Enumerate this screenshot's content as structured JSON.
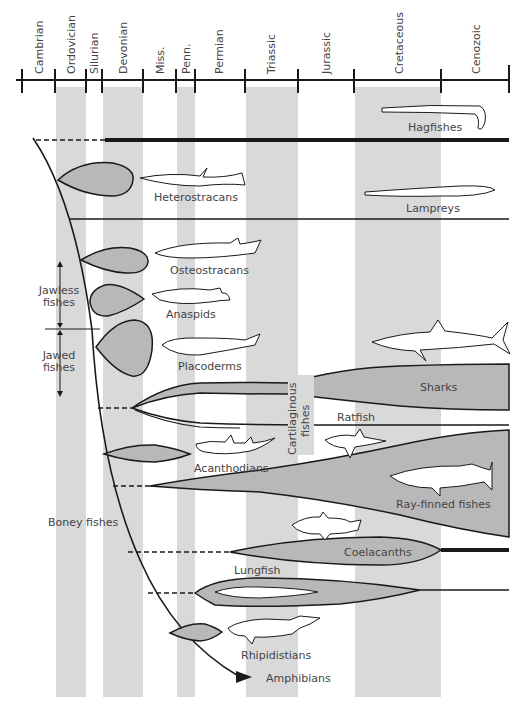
{
  "colors": {
    "band": "#d9d9d9",
    "fill": "#b8b8b8",
    "line": "#1a1a1a",
    "text": "#444444"
  },
  "time_axis": {
    "periods": [
      {
        "name": "Cambrian",
        "x0": 22,
        "x1": 55,
        "shaded": false
      },
      {
        "name": "Ordovician",
        "x0": 55,
        "x1": 86,
        "shaded": true
      },
      {
        "name": "Silurian",
        "x0": 86,
        "x1": 102,
        "shaded": false
      },
      {
        "name": "Devonian",
        "x0": 102,
        "x1": 143,
        "shaded": true
      },
      {
        "name": "Miss.",
        "x0": 143,
        "x1": 176,
        "shaded": false
      },
      {
        "name": "Penn.",
        "x0": 176,
        "x1": 195,
        "shaded": true
      },
      {
        "name": "Permian",
        "x0": 195,
        "x1": 245,
        "shaded": false
      },
      {
        "name": "Triassic",
        "x0": 245,
        "x1": 298,
        "shaded": true
      },
      {
        "name": "Jurassic",
        "x0": 298,
        "x1": 354,
        "shaded": false
      },
      {
        "name": "Cretaceous",
        "x0": 354,
        "x1": 441,
        "shaded": true
      },
      {
        "name": "Cenozoic",
        "x0": 441,
        "x1": 509,
        "shaded": false
      }
    ]
  },
  "groups": {
    "jawless": "Jawless fishes",
    "jawless_line1": "Jawless",
    "jawless_line2": "fishes",
    "jawed": "Jawed fishes",
    "jawed_line1": "Jawed",
    "jawed_line2": "fishes",
    "cartilaginous_line1": "Cartilaginous",
    "cartilaginous_line2": "fishes",
    "boney": "Boney fishes"
  },
  "taxa": [
    {
      "id": "hagfishes",
      "label": "Hagfishes"
    },
    {
      "id": "heterostracans",
      "label": "Heterostracans"
    },
    {
      "id": "lampreys",
      "label": "Lampreys"
    },
    {
      "id": "osteostracans",
      "label": "Osteostracans"
    },
    {
      "id": "anaspids",
      "label": "Anaspids"
    },
    {
      "id": "placoderms",
      "label": "Placoderms"
    },
    {
      "id": "sharks",
      "label": "Sharks"
    },
    {
      "id": "ratfish",
      "label": "Ratfish"
    },
    {
      "id": "acanthodians",
      "label": "Acanthodians"
    },
    {
      "id": "ray-finned",
      "label": "Ray-finned fishes"
    },
    {
      "id": "coelacanths",
      "label": "Coelacanths"
    },
    {
      "id": "lungfish",
      "label": "Lungfish"
    },
    {
      "id": "rhipidistians",
      "label": "Rhipidistians"
    },
    {
      "id": "amphibians",
      "label": "Amphibians"
    }
  ]
}
